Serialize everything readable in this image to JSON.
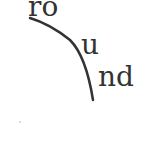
{
  "fragments": [
    {
      "text": "ro"
    },
    {
      "text": "u"
    },
    {
      "text": "nd"
    }
  ],
  "curve": {
    "color": "#333333"
  }
}
